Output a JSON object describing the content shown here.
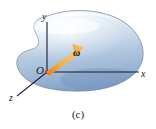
{
  "figure": {
    "caption": "(c)",
    "background_color": "#ffffff",
    "body": {
      "name": "rigid-body-blob",
      "description": "amoeba-shaped rigid body",
      "fill_top_color": "#e8eef6",
      "fill_mid_color": "#b9cbe2",
      "fill_bottom_color": "#8ba8ca",
      "outline_color": "#6d7f94"
    },
    "axes": {
      "x_label": "x",
      "y_label": "y",
      "z_label": "z",
      "origin_label": "O",
      "axis_color": "#1b1b2e",
      "origin_dot_color": "#d9232e"
    },
    "vector": {
      "label": "ω",
      "name": "angular-velocity-vector",
      "color_light": "#f7c35a",
      "color_dark": "#e07c18"
    }
  }
}
